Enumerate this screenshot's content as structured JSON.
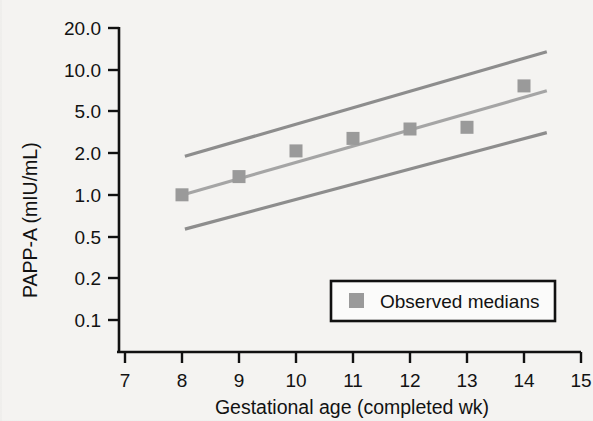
{
  "chart_data": {
    "type": "scatter",
    "title": "",
    "xlabel": "Gestational age (completed wk)",
    "ylabel": "PAPP-A (mIU/mL)",
    "xlim": [
      7,
      15
    ],
    "ylim": [
      0.1,
      20.0
    ],
    "yscale": "log",
    "grid": false,
    "xticks": [
      "7",
      "8",
      "9",
      "10",
      "11",
      "12",
      "13",
      "14",
      "15"
    ],
    "yticks": [
      "20.0",
      "10.0",
      "5.0",
      "2.0",
      "1.0",
      "0.5",
      "0.2",
      "0.1"
    ],
    "legend": {
      "position": "lower-right",
      "entries": [
        {
          "label": "Observed medians",
          "marker": "square",
          "color": "#9a9a9a"
        }
      ]
    },
    "series": [
      {
        "name": "Observed medians",
        "type": "scatter",
        "marker": "square",
        "color": "#9a9a9a",
        "x": [
          8,
          9,
          10,
          11,
          12,
          13,
          14
        ],
        "y": [
          0.97,
          1.35,
          2.15,
          2.7,
          3.2,
          3.3,
          7.0
        ]
      },
      {
        "name": "Fitted median",
        "type": "line",
        "color": "#a5a5a5",
        "x": [
          8.05,
          14.4
        ],
        "y": [
          0.98,
          6.4
        ]
      },
      {
        "name": "Upper reference limit",
        "type": "line",
        "color": "#8d8d8d",
        "x": [
          8.05,
          14.4
        ],
        "y": [
          1.95,
          13.0
        ]
      },
      {
        "name": "Lower reference limit",
        "type": "line",
        "color": "#8d8d8d",
        "x": [
          8.05,
          14.4
        ],
        "y": [
          0.52,
          3.0
        ]
      }
    ]
  },
  "axes": {
    "y_title": "PAPP-A (mIU/mL)",
    "x_title": "Gestational age (completed wk)",
    "y_tick_0": "20.0",
    "y_tick_1": "10.0",
    "y_tick_2": "5.0",
    "y_tick_3": "2.0",
    "y_tick_4": "1.0",
    "y_tick_5": "0.5",
    "y_tick_6": "0.2",
    "y_tick_7": "0.1",
    "x_tick_0": "7",
    "x_tick_1": "8",
    "x_tick_2": "9",
    "x_tick_3": "10",
    "x_tick_4": "11",
    "x_tick_5": "12",
    "x_tick_6": "13",
    "x_tick_7": "14",
    "x_tick_8": "15"
  },
  "legend": {
    "observed_medians_label": "Observed medians"
  },
  "colors": {
    "marker": "#9a9a9a",
    "center_line": "#a8a8a8",
    "bound_line": "#8d8d8d",
    "axis": "#111111",
    "text": "#121212",
    "background": "#f5f4f2"
  }
}
